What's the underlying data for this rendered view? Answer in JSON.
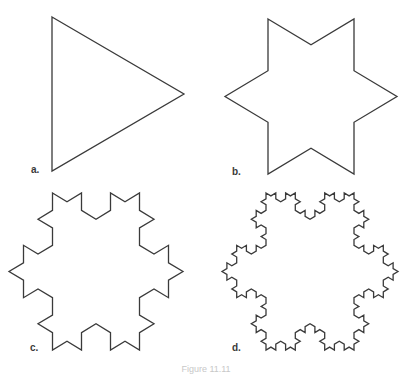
{
  "figure": {
    "caption": "Figure 11.11",
    "stroke_color": "#3a3a3a",
    "stroke_width": 1.3,
    "panels": [
      {
        "id": "a",
        "label": "a.",
        "iterations": 0,
        "label_pos": [
          31,
          164
        ],
        "triangle": [
          [
            52,
            17
          ],
          [
            184,
            95
          ],
          [
            52,
            171
          ]
        ]
      },
      {
        "id": "b",
        "label": "b.",
        "iterations": 1,
        "label_pos": [
          232,
          166
        ],
        "triangle": [
          [
            269,
            19
          ],
          [
            397,
            95
          ],
          [
            269,
            174
          ]
        ]
      },
      {
        "id": "c",
        "label": "c.",
        "iterations": 2,
        "label_pos": [
          30,
          342
        ],
        "triangle": [
          [
            52,
            193
          ],
          [
            183,
            272
          ],
          [
            52,
            350
          ]
        ]
      },
      {
        "id": "d",
        "label": "d.",
        "iterations": 3,
        "label_pos": [
          232,
          342
        ],
        "triangle": [
          [
            252,
            193
          ],
          [
            398,
            272
          ],
          [
            252,
            350
          ]
        ]
      }
    ]
  }
}
